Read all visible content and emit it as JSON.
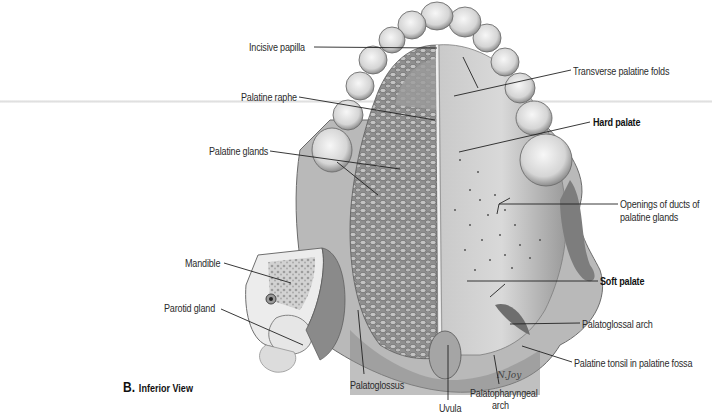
{
  "figure": {
    "caption_letter": "B.",
    "caption_text": "Inferior View",
    "artist_signature": "N.Joy"
  },
  "labels": {
    "incisive_papilla": "Incisive papilla",
    "transverse_palatine_folds": "Transverse palatine folds",
    "palatine_raphe": "Palatine raphe",
    "hard_palate": "Hard palate",
    "palatine_glands": "Palatine glands",
    "openings_of_ducts_line1": "Openings of ducts of",
    "openings_of_ducts_line2": "palatine glands",
    "mandible": "Mandible",
    "soft_palate": "Soft palate",
    "parotid_gland": "Parotid gland",
    "palatoglossal_arch": "Palatoglossal arch",
    "palatine_tonsil": "Palatine tonsil in palatine fossa",
    "palatoglossus": "Palatoglossus",
    "uvula": "Uvula",
    "palatopharyngeal_line1": "Palatopharyngeal",
    "palatopharyngeal_line2": "arch"
  },
  "colors": {
    "background": "#ffffff",
    "label_text": "#2b2b2b",
    "leader_line": "#222222",
    "tissue_light": "#dcdcdc",
    "tissue_mid": "#a8a8a8",
    "tissue_dark": "#6e6e6e"
  }
}
